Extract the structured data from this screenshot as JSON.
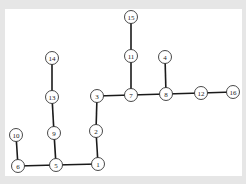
{
  "diagram": {
    "type": "tree-graph",
    "colors": {
      "background_margin": "#e6e6e6",
      "panel": "#ffffff",
      "edge": "#1a1a1a",
      "node_stroke": "#333333",
      "label": "#222222"
    },
    "nodes": [
      {
        "id": "1",
        "label": "1",
        "x": 98,
        "y": 164
      },
      {
        "id": "2",
        "label": "2",
        "x": 96,
        "y": 131
      },
      {
        "id": "3",
        "label": "3",
        "x": 97,
        "y": 96
      },
      {
        "id": "4",
        "label": "4",
        "x": 165,
        "y": 57
      },
      {
        "id": "5",
        "label": "5",
        "x": 56,
        "y": 165
      },
      {
        "id": "6",
        "label": "6",
        "x": 18,
        "y": 166
      },
      {
        "id": "7",
        "label": "7",
        "x": 131,
        "y": 95
      },
      {
        "id": "8",
        "label": "8",
        "x": 166,
        "y": 94
      },
      {
        "id": "9",
        "label": "9",
        "x": 54,
        "y": 133
      },
      {
        "id": "10",
        "label": "10",
        "x": 16,
        "y": 135
      },
      {
        "id": "11",
        "label": "11",
        "x": 131,
        "y": 56
      },
      {
        "id": "12",
        "label": "12",
        "x": 201,
        "y": 93
      },
      {
        "id": "13",
        "label": "13",
        "x": 52,
        "y": 97
      },
      {
        "id": "14",
        "label": "14",
        "x": 52,
        "y": 58
      },
      {
        "id": "15",
        "label": "15",
        "x": 131,
        "y": 17
      },
      {
        "id": "16",
        "label": "16",
        "x": 233,
        "y": 92
      }
    ],
    "edges": [
      [
        "6",
        "5"
      ],
      [
        "5",
        "1"
      ],
      [
        "10",
        "6"
      ],
      [
        "9",
        "5"
      ],
      [
        "13",
        "9"
      ],
      [
        "14",
        "13"
      ],
      [
        "1",
        "2"
      ],
      [
        "2",
        "3"
      ],
      [
        "3",
        "7"
      ],
      [
        "7",
        "8"
      ],
      [
        "8",
        "12"
      ],
      [
        "12",
        "16"
      ],
      [
        "11",
        "7"
      ],
      [
        "15",
        "11"
      ],
      [
        "4",
        "8"
      ]
    ],
    "node_radius": 6.5
  }
}
